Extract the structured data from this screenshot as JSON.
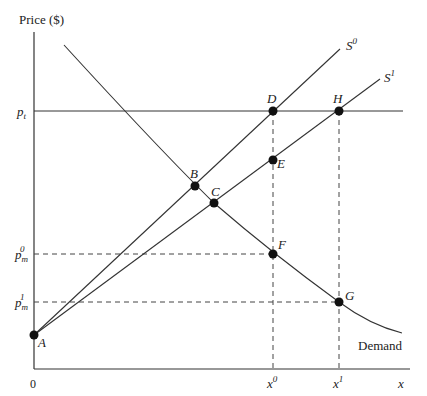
{
  "diagram": {
    "y_axis_label": "Price ($)",
    "x_axis_label": "x",
    "origin_label": "0",
    "price_labels": {
      "p_t": {
        "base": "p",
        "sub": "t"
      },
      "p_m0": {
        "base": "p",
        "sub": "m",
        "sup": "0"
      },
      "p_m1": {
        "base": "p",
        "sub": "m",
        "sup": "1"
      }
    },
    "quantity_labels": {
      "x0": {
        "base": "x",
        "sup": "0"
      },
      "x1": {
        "base": "x",
        "sup": "1"
      }
    },
    "curves": {
      "supply0": {
        "base": "S",
        "sup": "0"
      },
      "supply1": {
        "base": "S",
        "sup": "1"
      },
      "demand": "Demand"
    },
    "points": [
      "A",
      "B",
      "C",
      "D",
      "E",
      "F",
      "G",
      "H"
    ],
    "colors": {
      "line": "#333333",
      "point": "#111111",
      "background": "#ffffff"
    }
  }
}
